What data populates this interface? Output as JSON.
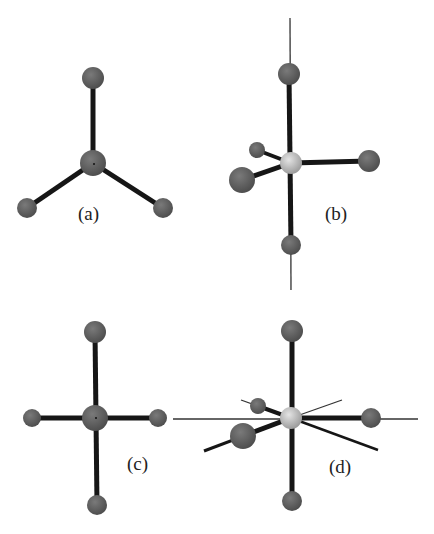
{
  "figure": {
    "panels": [
      {
        "id": "a",
        "label": "(a)",
        "geometry": "trigonal planar (3 ligands)"
      },
      {
        "id": "b",
        "label": "(b)",
        "geometry": "trigonal bipyramidal view with axis"
      },
      {
        "id": "c",
        "label": "(c)",
        "geometry": "square planar (4 ligands)"
      },
      {
        "id": "d",
        "label": "(d)",
        "geometry": "octahedral-like view with axes"
      }
    ],
    "colors": {
      "ligand_atom": "#5f5f5f",
      "central_atom_dark": "#5a5a5a",
      "central_atom_light": "#c8c8c8",
      "bond": "#161616",
      "axis_line": "#333333",
      "background": "#ffffff"
    }
  }
}
